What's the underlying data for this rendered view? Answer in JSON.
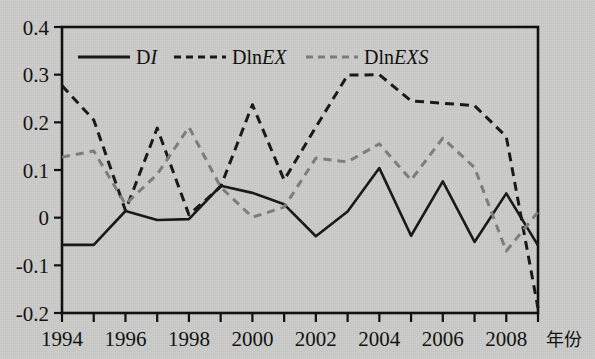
{
  "figure": {
    "background_color": "#cbcbc9",
    "frame_color": "#111111",
    "x_axis_title": "年份"
  },
  "legend": {
    "items": [
      {
        "key": "DI",
        "prefix": "D",
        "italic": "I",
        "suffix": "",
        "style": "solid",
        "color": "#1a1a1a"
      },
      {
        "key": "DlnEX",
        "prefix": "Dln",
        "italic": "EX",
        "suffix": "",
        "style": "dashed",
        "color": "#1a1a1a"
      },
      {
        "key": "DlnEXS",
        "prefix": "Dln",
        "italic": "EXS",
        "suffix": "",
        "style": "dashed",
        "color": "#7d7d7d"
      }
    ]
  },
  "chart_data": {
    "type": "line",
    "title": "",
    "xlabel": "年份",
    "ylabel": "",
    "xlim": [
      1994,
      2009
    ],
    "ylim": [
      -0.2,
      0.4
    ],
    "ytick_values": [
      0.4,
      0.3,
      0.2,
      0.1,
      0,
      -0.1,
      -0.2
    ],
    "ytick_labels": [
      "0.4",
      "0.3",
      "0.2",
      "0.1",
      "0",
      "-0.1",
      "-0.2"
    ],
    "x": [
      1994,
      1995,
      1996,
      1997,
      1998,
      1999,
      2000,
      2001,
      2002,
      2003,
      2004,
      2005,
      2006,
      2007,
      2008,
      2009
    ],
    "xtick_values": [
      1994,
      1995,
      1996,
      1997,
      1998,
      1999,
      2000,
      2001,
      2002,
      2003,
      2004,
      2005,
      2006,
      2007,
      2008,
      2009
    ],
    "xtick_labels": [
      "1994",
      "",
      "1996",
      "",
      "1998",
      "",
      "2000",
      "",
      "2002",
      "",
      "2004",
      "",
      "2006",
      "",
      "2008",
      ""
    ],
    "grid": false,
    "legend_position": "top-left-inside",
    "series": [
      {
        "name": "DI",
        "style": "solid",
        "color": "#1a1a1a",
        "values": [
          -0.057,
          -0.057,
          0.014,
          -0.005,
          -0.003,
          0.067,
          0.052,
          0.028,
          -0.039,
          0.013,
          0.104,
          -0.038,
          0.076,
          -0.051,
          0.051,
          -0.058
        ]
      },
      {
        "name": "DlnEX",
        "style": "dashed",
        "color": "#1a1a1a",
        "values": [
          0.277,
          0.205,
          0.015,
          0.188,
          0.006,
          0.065,
          0.237,
          0.079,
          0.19,
          0.299,
          0.3,
          0.245,
          0.24,
          0.235,
          0.17,
          -0.19
        ]
      },
      {
        "name": "DlnEXS",
        "style": "dashed",
        "color": "#7d7d7d",
        "values": [
          0.127,
          0.14,
          0.028,
          0.091,
          0.19,
          0.064,
          0.001,
          0.022,
          0.125,
          0.117,
          0.155,
          0.079,
          0.167,
          0.105,
          -0.07,
          0.012
        ]
      }
    ]
  }
}
